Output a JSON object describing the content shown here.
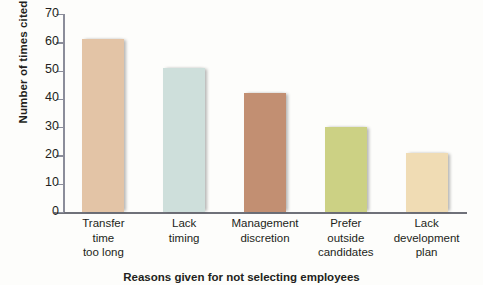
{
  "chart_data": {
    "type": "bar",
    "title": "",
    "xlabel": "Reasons given for not selecting employees",
    "ylabel": "Number of times cited",
    "categories": [
      "Transfer time too long",
      "Lack timing",
      "Management discretion",
      "Prefer outside candidates",
      "Lack development plan"
    ],
    "category_lines": [
      [
        "Transfer",
        "time",
        "too long"
      ],
      [
        "Lack",
        "timing"
      ],
      [
        "Management",
        "discretion"
      ],
      [
        "Prefer",
        "outside",
        "candidates"
      ],
      [
        "Lack",
        "development",
        "plan"
      ]
    ],
    "values": [
      61,
      51,
      42,
      30,
      21
    ],
    "ylim": [
      0,
      70
    ],
    "ytick_step": 10,
    "yticks": [
      0,
      10,
      20,
      30,
      40,
      50,
      60,
      70
    ],
    "ytick_labels": [
      "0",
      "10",
      "20",
      "30",
      "40",
      "50",
      "60",
      "70"
    ],
    "grid": false,
    "legend": "none",
    "bar_colors": [
      "#e3c4a6",
      "#cedfdb",
      "#c28f72",
      "#ccd184",
      "#f0dcb4"
    ],
    "axis_color": "#8b8d9a"
  }
}
